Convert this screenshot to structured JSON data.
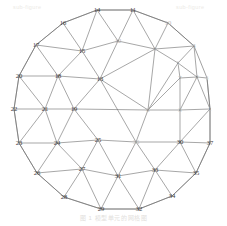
{
  "figure": {
    "caption": "图 1  模型单元的网格图",
    "watermark_left": "sub-figure",
    "watermark_right": "sub-figure",
    "domain_shape": "circle"
  },
  "chart_data": {
    "type": "diagram-mesh",
    "title": "图 1  模型单元的网格图",
    "xlabel": "",
    "ylabel": "",
    "grid": false,
    "legend": "none",
    "xlim": [
      0,
      227
    ],
    "ylim": [
      0,
      226
    ],
    "nodes": [
      {
        "id": "1",
        "x": 210,
        "y": 109,
        "visible": "faint"
      },
      {
        "id": "2",
        "x": 197,
        "y": 77,
        "visible": "faint"
      },
      {
        "id": "3",
        "x": 180,
        "y": 110,
        "visible": "faint"
      },
      {
        "id": "4",
        "x": 207,
        "y": 78,
        "visible": "veryfaint"
      },
      {
        "id": "5",
        "x": 178,
        "y": 63,
        "visible": "veryfaint"
      },
      {
        "id": "6",
        "x": 148,
        "y": 110,
        "visible": "faint"
      },
      {
        "id": "7",
        "x": 180,
        "y": 78,
        "visible": "faint"
      },
      {
        "id": "8",
        "x": 194,
        "y": 46,
        "visible": "faint"
      },
      {
        "id": "9",
        "x": 155,
        "y": 49,
        "visible": "faint"
      },
      {
        "id": "10",
        "x": 168,
        "y": 23,
        "visible": "faint"
      },
      {
        "id": "11",
        "x": 133,
        "y": 10,
        "visible": "normal"
      },
      {
        "id": "12",
        "x": 118,
        "y": 41,
        "visible": "faint"
      },
      {
        "id": "13",
        "x": 100,
        "y": 79,
        "visible": "normal"
      },
      {
        "id": "14",
        "x": 97,
        "y": 10,
        "visible": "normal"
      },
      {
        "id": "15",
        "x": 82,
        "y": 51,
        "visible": "normal"
      },
      {
        "id": "16",
        "x": 63,
        "y": 23,
        "visible": "normal"
      },
      {
        "id": "17",
        "x": 36,
        "y": 45,
        "visible": "normal"
      },
      {
        "id": "18",
        "x": 58,
        "y": 76,
        "visible": "normal"
      },
      {
        "id": "19",
        "x": 74,
        "y": 109,
        "visible": "normal"
      },
      {
        "id": "20",
        "x": 19,
        "y": 76,
        "visible": "normal"
      },
      {
        "id": "21",
        "x": 45,
        "y": 109,
        "visible": "normal"
      },
      {
        "id": "22",
        "x": 14,
        "y": 109,
        "visible": "normal"
      },
      {
        "id": "23",
        "x": 19,
        "y": 143,
        "visible": "normal"
      },
      {
        "id": "24",
        "x": 57,
        "y": 143,
        "visible": "normal"
      },
      {
        "id": "25",
        "x": 98,
        "y": 140,
        "visible": "normal"
      },
      {
        "id": "26",
        "x": 37,
        "y": 173,
        "visible": "normal"
      },
      {
        "id": "27",
        "x": 82,
        "y": 169,
        "visible": "normal"
      },
      {
        "id": "28",
        "x": 64,
        "y": 197,
        "visible": "normal"
      },
      {
        "id": "29",
        "x": 101,
        "y": 209,
        "visible": "normal"
      },
      {
        "id": "30",
        "x": 180,
        "y": 142,
        "visible": "normal"
      },
      {
        "id": "31",
        "x": 118,
        "y": 176,
        "visible": "normal"
      },
      {
        "id": "32",
        "x": 139,
        "y": 209,
        "visible": "normal"
      },
      {
        "id": "33",
        "x": 155,
        "y": 170,
        "visible": "normal"
      },
      {
        "id": "34",
        "x": 172,
        "y": 196,
        "visible": "normal"
      },
      {
        "id": "35",
        "x": 196,
        "y": 173,
        "visible": "normal"
      },
      {
        "id": "36",
        "x": 136,
        "y": 142,
        "visible": "faint"
      },
      {
        "id": "37",
        "x": 210,
        "y": 143,
        "visible": "normal"
      }
    ],
    "edges": [
      [
        "14",
        "11"
      ],
      [
        "14",
        "16"
      ],
      [
        "14",
        "15"
      ],
      [
        "14",
        "12"
      ],
      [
        "11",
        "12"
      ],
      [
        "11",
        "10"
      ],
      [
        "11",
        "9"
      ],
      [
        "10",
        "9"
      ],
      [
        "10",
        "8"
      ],
      [
        "16",
        "17"
      ],
      [
        "16",
        "15"
      ],
      [
        "17",
        "15"
      ],
      [
        "17",
        "18"
      ],
      [
        "17",
        "20"
      ],
      [
        "15",
        "12"
      ],
      [
        "15",
        "13"
      ],
      [
        "15",
        "18"
      ],
      [
        "12",
        "13"
      ],
      [
        "12",
        "9"
      ],
      [
        "9",
        "13"
      ],
      [
        "9",
        "8"
      ],
      [
        "9",
        "6"
      ],
      [
        "9",
        "5"
      ],
      [
        "8",
        "5"
      ],
      [
        "8",
        "2"
      ],
      [
        "20",
        "18"
      ],
      [
        "20",
        "22"
      ],
      [
        "20",
        "21"
      ],
      [
        "18",
        "13"
      ],
      [
        "18",
        "21"
      ],
      [
        "18",
        "19"
      ],
      [
        "13",
        "19"
      ],
      [
        "13",
        "6"
      ],
      [
        "13",
        "36"
      ],
      [
        "6",
        "19"
      ],
      [
        "6",
        "36"
      ],
      [
        "6",
        "5"
      ],
      [
        "6",
        "3"
      ],
      [
        "6",
        "7"
      ],
      [
        "5",
        "7"
      ],
      [
        "5",
        "2"
      ],
      [
        "2",
        "7"
      ],
      [
        "2",
        "4"
      ],
      [
        "2",
        "1"
      ],
      [
        "2",
        "3"
      ],
      [
        "4",
        "1"
      ],
      [
        "22",
        "21"
      ],
      [
        "22",
        "23"
      ],
      [
        "21",
        "19"
      ],
      [
        "21",
        "23"
      ],
      [
        "21",
        "24"
      ],
      [
        "19",
        "24"
      ],
      [
        "19",
        "25"
      ],
      [
        "36",
        "25"
      ],
      [
        "36",
        "30"
      ],
      [
        "36",
        "33"
      ],
      [
        "36",
        "31"
      ],
      [
        "3",
        "1"
      ],
      [
        "3",
        "30"
      ],
      [
        "3",
        "7"
      ],
      [
        "1",
        "37"
      ],
      [
        "1",
        "30"
      ],
      [
        "23",
        "24"
      ],
      [
        "23",
        "26"
      ],
      [
        "24",
        "25"
      ],
      [
        "24",
        "26"
      ],
      [
        "24",
        "27"
      ],
      [
        "25",
        "27"
      ],
      [
        "25",
        "31"
      ],
      [
        "30",
        "37"
      ],
      [
        "30",
        "33"
      ],
      [
        "30",
        "35"
      ],
      [
        "37",
        "35"
      ],
      [
        "26",
        "27"
      ],
      [
        "26",
        "28"
      ],
      [
        "27",
        "28"
      ],
      [
        "27",
        "29"
      ],
      [
        "27",
        "31"
      ],
      [
        "28",
        "29"
      ],
      [
        "29",
        "31"
      ],
      [
        "29",
        "32"
      ],
      [
        "31",
        "32"
      ],
      [
        "31",
        "33"
      ],
      [
        "32",
        "33"
      ],
      [
        "32",
        "34"
      ],
      [
        "33",
        "34"
      ],
      [
        "33",
        "35"
      ],
      [
        "34",
        "35"
      ]
    ],
    "boundary_cycle": [
      "14",
      "11",
      "10",
      "8",
      "4",
      "1",
      "37",
      "35",
      "34",
      "32",
      "29",
      "28",
      "26",
      "23",
      "22",
      "20",
      "17",
      "16"
    ]
  }
}
